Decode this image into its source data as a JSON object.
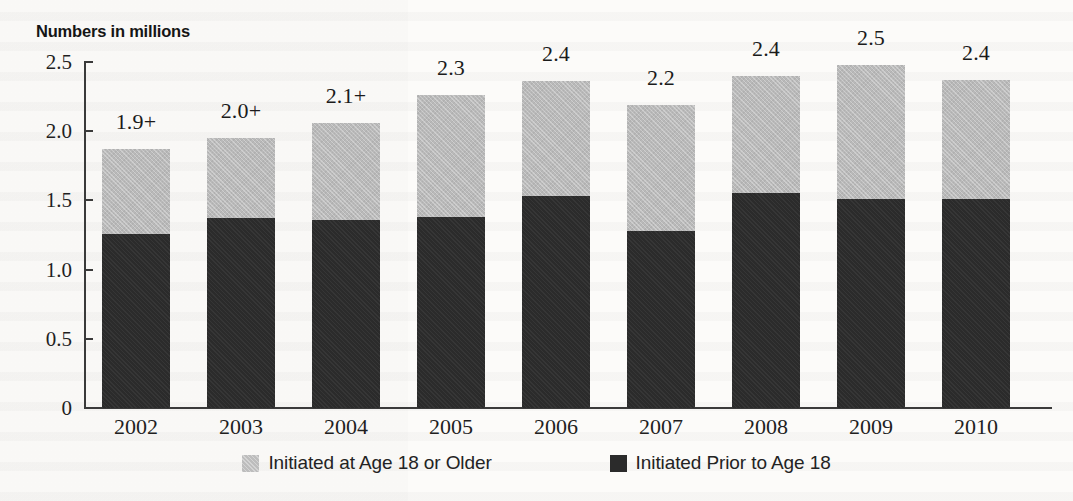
{
  "chart_data": {
    "type": "bar",
    "subtype": "stacked-vertical",
    "title": "Numbers in millions",
    "xlabel": "",
    "ylabel": "Numbers in millions",
    "ylim": [
      0,
      2.5
    ],
    "yticks": [
      "0",
      "0.5",
      "1.0",
      "1.5",
      "2.0",
      "2.5"
    ],
    "ytick_values": [
      0,
      0.5,
      1.0,
      1.5,
      2.0,
      2.5
    ],
    "grid": false,
    "legend_position": "bottom",
    "categories": [
      "2002",
      "2003",
      "2004",
      "2005",
      "2006",
      "2007",
      "2008",
      "2009",
      "2010"
    ],
    "series": [
      {
        "name": "Initiated Prior to Age 18",
        "color": "#2b2b2b",
        "values": [
          1.26,
          1.37,
          1.36,
          1.38,
          1.53,
          1.28,
          1.55,
          1.51,
          1.51
        ]
      },
      {
        "name": "Initiated at Age 18 or Older",
        "color": "#bdbdbd",
        "values": [
          0.61,
          0.58,
          0.7,
          0.88,
          0.83,
          0.91,
          0.85,
          0.97,
          0.86
        ]
      }
    ],
    "totals": [
      1.87,
      1.95,
      2.06,
      2.26,
      2.36,
      2.19,
      2.4,
      2.48,
      2.37
    ],
    "bar_labels": [
      "1.9+",
      "2.0+",
      "2.1+",
      "2.3",
      "2.4",
      "2.2",
      "2.4",
      "2.5",
      "2.4"
    ],
    "bars": [
      {
        "category": "2002",
        "label": "1.9+",
        "total": 1.87,
        "prior_to_18": 1.26,
        "age_18_or_older": 0.61
      },
      {
        "category": "2003",
        "label": "2.0+",
        "total": 1.95,
        "prior_to_18": 1.37,
        "age_18_or_older": 0.58
      },
      {
        "category": "2004",
        "label": "2.1+",
        "total": 2.06,
        "prior_to_18": 1.36,
        "age_18_or_older": 0.7
      },
      {
        "category": "2005",
        "label": "2.3",
        "total": 2.26,
        "prior_to_18": 1.38,
        "age_18_or_older": 0.88
      },
      {
        "category": "2006",
        "label": "2.4",
        "total": 2.36,
        "prior_to_18": 1.53,
        "age_18_or_older": 0.83
      },
      {
        "category": "2007",
        "label": "2.2",
        "total": 2.19,
        "prior_to_18": 1.28,
        "age_18_or_older": 0.91
      },
      {
        "category": "2008",
        "label": "2.4",
        "total": 2.4,
        "prior_to_18": 1.55,
        "age_18_or_older": 0.85
      },
      {
        "category": "2009",
        "label": "2.5",
        "total": 2.48,
        "prior_to_18": 1.51,
        "age_18_or_older": 0.97
      },
      {
        "category": "2010",
        "label": "2.4",
        "total": 2.37,
        "prior_to_18": 1.51,
        "age_18_or_older": 0.86
      }
    ],
    "legend": [
      {
        "label": "Initiated at Age 18 or Older",
        "color": "#bdbdbd"
      },
      {
        "label": "Initiated Prior to Age 18",
        "color": "#2b2b2b"
      }
    ]
  },
  "colors": {
    "light_segment": "#bdbdbd",
    "dark_segment": "#2b2b2b",
    "axis": "#3a3a3a",
    "text": "#1c1c1c",
    "page": "#fdfdfb"
  }
}
